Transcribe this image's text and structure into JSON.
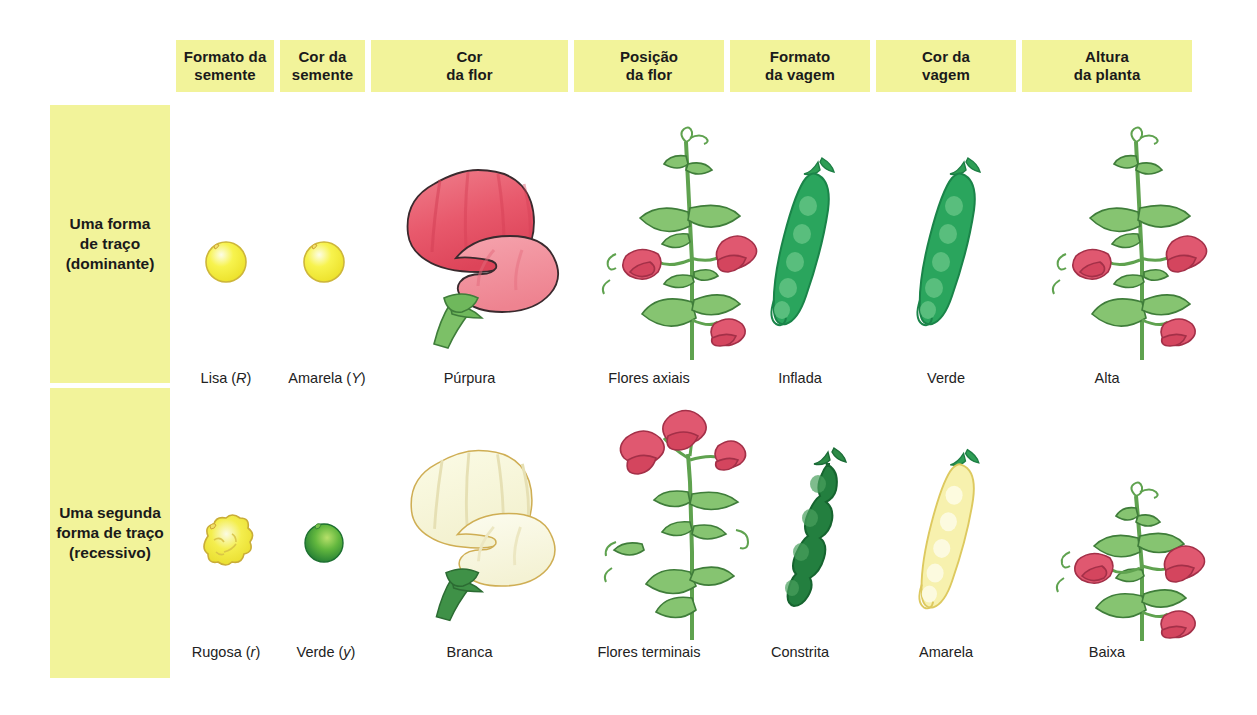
{
  "figure": {
    "background_color": "#ffffff",
    "band_color": "#f2f39a"
  },
  "columns": [
    {
      "id": "seed-shape",
      "header": "Formato da\nsemente",
      "header_line1": "Formato da",
      "header_line2": "semente"
    },
    {
      "id": "seed-color",
      "header": "Cor da\nsemente",
      "header_line1": "Cor da",
      "header_line2": "semente"
    },
    {
      "id": "flower-color",
      "header": "Cor\nda flor",
      "header_line1": "Cor",
      "header_line2": "da flor"
    },
    {
      "id": "flower-position",
      "header": "Posição\nda flor",
      "header_line1": "Posição",
      "header_line2": "da flor"
    },
    {
      "id": "pod-shape",
      "header": "Formato\nda vagem",
      "header_line1": "Formato",
      "header_line2": "da vagem"
    },
    {
      "id": "pod-color",
      "header": "Cor da\nvagem",
      "header_line1": "Cor da",
      "header_line2": "vagem"
    },
    {
      "id": "plant-height",
      "header": "Altura\nda planta",
      "header_line1": "Altura",
      "header_line2": "da planta"
    }
  ],
  "rows": [
    {
      "id": "dominant",
      "label_line1": "Uma forma",
      "label_line2": "de traço",
      "label_line3": "(dominante)",
      "captions": [
        {
          "text": "Lisa",
          "allele": "R"
        },
        {
          "text": "Amarela",
          "allele": "Y"
        },
        {
          "text": "Púrpura",
          "allele": ""
        },
        {
          "text": "Flores axiais",
          "allele": ""
        },
        {
          "text": "Inflada",
          "allele": ""
        },
        {
          "text": "Verde",
          "allele": ""
        },
        {
          "text": "Alta",
          "allele": ""
        }
      ]
    },
    {
      "id": "recessive",
      "label_line1": "Uma segunda",
      "label_line2": "forma de traço",
      "label_line3": "(recessivo)",
      "captions": [
        {
          "text": "Rugosa",
          "allele": "r"
        },
        {
          "text": "Verde",
          "allele": "y"
        },
        {
          "text": "Branca",
          "allele": ""
        },
        {
          "text": "Flores terminais",
          "allele": ""
        },
        {
          "text": "Constrita",
          "allele": ""
        },
        {
          "text": "Amarela",
          "allele": ""
        },
        {
          "text": "Baixa",
          "allele": ""
        }
      ]
    }
  ],
  "illustrations": {
    "seed_round_yellow": "seed-round-yellow-icon",
    "seed_wrinkled_yellow": "seed-wrinkled-yellow-icon",
    "seed_round_green": "seed-round-green-icon",
    "flower_purple": "flower-purple-icon",
    "flower_white": "flower-white-icon",
    "plant_axial": "plant-axial-flowers-icon",
    "plant_terminal": "plant-terminal-flowers-icon",
    "pod_inflated_green": "pod-inflated-green-icon",
    "pod_constricted_green": "pod-constricted-green-icon",
    "pod_green": "pod-green-icon",
    "pod_yellow": "pod-yellow-icon",
    "plant_tall": "plant-tall-icon",
    "plant_short": "plant-short-icon"
  },
  "colors": {
    "band": "#f2f39a",
    "seed_yellow": "#f5ef2a",
    "seed_yellow_edge": "#cdb63a",
    "seed_green": "#4aa832",
    "flower_red": "#e8566a",
    "flower_red_dark": "#cf3a52",
    "flower_cream": "#f7f6d8",
    "flower_cream_edge": "#d9bf63",
    "leaf_green": "#7ebf6a",
    "leaf_green_dark": "#3f7d3a",
    "pod_green": "#28a05a",
    "pod_green_dark": "#1d8a4c",
    "pod_deep_green": "#217a3d",
    "pod_yellow": "#f6efa8",
    "pod_yellow_edge": "#dcc95c",
    "text": "#1b1b1b"
  }
}
